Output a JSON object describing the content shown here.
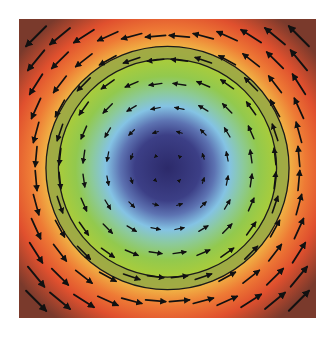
{
  "chart_data": {
    "type": "quiver",
    "title": "",
    "xlabel": "",
    "ylabel": "",
    "grid": false,
    "legend": null,
    "background": "radial colormap (scalar magnitude, low at center to high at corners)",
    "colormap_stops": [
      {
        "r": 0.0,
        "color": "#2c2a6a"
      },
      {
        "r": 0.25,
        "color": "#3c3f86"
      },
      {
        "r": 0.36,
        "color": "#5d73b2"
      },
      {
        "r": 0.47,
        "color": "#84c3e4"
      },
      {
        "r": 0.58,
        "color": "#8cca9a"
      },
      {
        "r": 0.7,
        "color": "#92c94e"
      },
      {
        "r": 0.82,
        "color": "#a8cc3c"
      },
      {
        "r": 0.92,
        "color": "#f0b545"
      },
      {
        "r": 1.05,
        "color": "#ee7a35"
      },
      {
        "r": 1.2,
        "color": "#e0502e"
      },
      {
        "r": 1.42,
        "color": "#7a3a2c"
      }
    ],
    "field": {
      "description": "counter-clockwise rotational field, magnitude proportional to distance from center",
      "u": "-y",
      "v": "x",
      "grid_x": [
        -1.0,
        -0.8182,
        -0.6364,
        -0.4545,
        -0.2727,
        -0.0909,
        0.0909,
        0.2727,
        0.4545,
        0.6364,
        0.8182,
        1.0
      ],
      "grid_y": [
        -1.0,
        -0.8182,
        -0.6364,
        -0.4545,
        -0.2727,
        -0.0909,
        0.0909,
        0.2727,
        0.4545,
        0.6364,
        0.8182,
        1.0
      ],
      "arrow_color": "#111111"
    },
    "annotations": [
      {
        "type": "circle",
        "radius": 0.925,
        "color": "#1a1a1a",
        "label": "outer ring"
      },
      {
        "type": "circle",
        "radius": 0.83,
        "color": "#1a1a1a",
        "label": "inner ring"
      },
      {
        "type": "annulus_band",
        "r_inner": 0.83,
        "r_outer": 0.925,
        "color": "#9aa845",
        "label": "highlighted band"
      }
    ],
    "xlim": [
      -1.13,
      1.13
    ],
    "ylim": [
      -1.13,
      1.13
    ]
  }
}
